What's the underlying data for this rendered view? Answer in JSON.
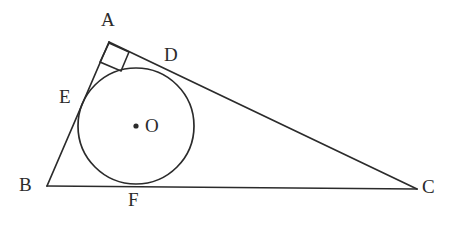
{
  "figure": {
    "kind": "geometry-diagram",
    "canvas": {
      "width": 450,
      "height": 227
    },
    "colors": {
      "background": "#ffffff",
      "stroke": "#2b2b2b",
      "label": "#2b2b2b"
    },
    "stroke_width": 1.7,
    "triangle": {
      "name": "triangle-abc",
      "vertices": [
        {
          "id": "A",
          "x": 109,
          "y": 42
        },
        {
          "id": "B",
          "x": 47,
          "y": 186
        },
        {
          "id": "C",
          "x": 417,
          "y": 189
        }
      ],
      "sides": [
        {
          "id": "AB",
          "from": "A",
          "to": "B"
        },
        {
          "id": "AC",
          "from": "A",
          "to": "C"
        },
        {
          "id": "BC",
          "from": "B",
          "to": "C"
        }
      ]
    },
    "circle": {
      "name": "inscribed-circle",
      "center": {
        "x": 136,
        "y": 126
      },
      "radius": 58,
      "center_dot_radius": 2.6
    },
    "right_angle_mark": {
      "at_vertex": "A",
      "points": "109,43 100,62 121,71 129,52"
    },
    "tangent_points": [
      {
        "id": "D",
        "x": 161,
        "y": 62,
        "on_side": "AC"
      },
      {
        "id": "E",
        "x": 86,
        "y": 98,
        "on_side": "AB"
      },
      {
        "id": "F",
        "x": 133,
        "y": 185,
        "on_side": "BC"
      }
    ],
    "labels": [
      {
        "id": "label-A",
        "text": "A",
        "x": 101,
        "y": 10
      },
      {
        "id": "label-D",
        "text": "D",
        "x": 164,
        "y": 45
      },
      {
        "id": "label-E",
        "text": "E",
        "x": 59,
        "y": 87
      },
      {
        "id": "label-O",
        "text": "O",
        "x": 145,
        "y": 116
      },
      {
        "id": "label-B",
        "text": "B",
        "x": 19,
        "y": 175
      },
      {
        "id": "label-F",
        "text": "F",
        "x": 128,
        "y": 190
      },
      {
        "id": "label-C",
        "text": "C",
        "x": 422,
        "y": 177
      }
    ]
  }
}
